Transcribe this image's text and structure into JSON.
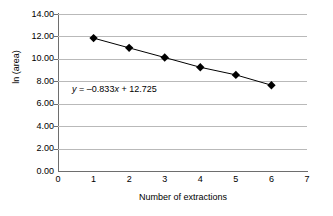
{
  "chart_data": {
    "type": "line",
    "title": "",
    "xlabel": "Number of extractions",
    "ylabel": "ln (area)",
    "x": [
      1,
      2,
      3,
      4,
      5,
      6
    ],
    "values": [
      11.85,
      10.98,
      10.12,
      9.25,
      8.57,
      7.65
    ],
    "series": [
      {
        "name": "ln (area)",
        "x": [
          1,
          2,
          3,
          4,
          5,
          6
        ],
        "values": [
          11.85,
          10.98,
          10.12,
          9.25,
          8.57,
          7.65
        ]
      }
    ],
    "xlim": [
      0,
      7
    ],
    "ylim": [
      0,
      14
    ],
    "xticks": [
      "0",
      "1",
      "2",
      "3",
      "4",
      "5",
      "6",
      "7"
    ],
    "yticks": [
      "0.00",
      "2.00",
      "4.00",
      "6.00",
      "8.00",
      "10.00",
      "12.00",
      "14.00"
    ],
    "ytick_values": [
      0,
      2,
      4,
      6,
      8,
      10,
      12,
      14
    ],
    "xtick_values": [
      0,
      1,
      2,
      3,
      4,
      5,
      6,
      7
    ],
    "grid": "horizontal",
    "legend": "none",
    "marker": "diamond",
    "marker_color": "#000000",
    "line_color": "#000000",
    "gridline_color": "#b9b9b9",
    "axis_color": "#6e6e6e",
    "annotations": [
      {
        "name": "trendline-equation",
        "text": "y = –0.833x + 12.725",
        "slope": -0.833,
        "intercept": 12.725
      }
    ]
  }
}
